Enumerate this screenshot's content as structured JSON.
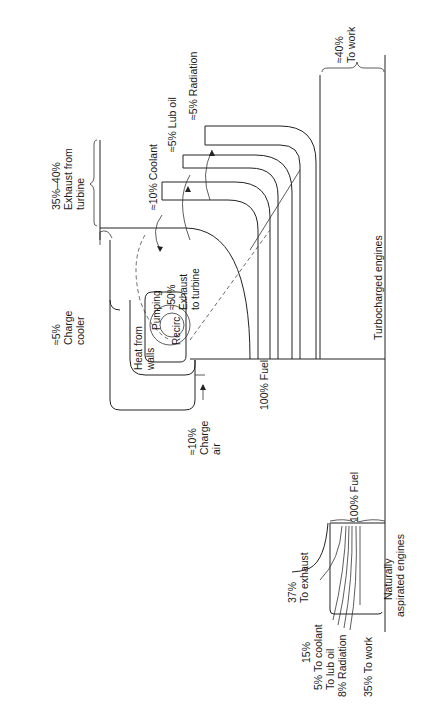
{
  "diagram": {
    "type": "sankey-energy-balance",
    "orientation": "rotated-90-ccw",
    "turbocharged": {
      "title": "Turbocharged engines",
      "fuel": "100% Fuel",
      "work": {
        "line1": "≈40%",
        "line2": "To work"
      },
      "radiation": "≈5% Radiation",
      "lub_oil": "≈5% Lub oil",
      "coolant": "≈10% Coolant",
      "exhaust_to_turbine": {
        "line1": "≈50%",
        "line2": "Exhaust",
        "line3": "to turbine"
      },
      "exhaust_from_turbine": {
        "line1": "35%–40%",
        "line2": "Exhaust from",
        "line3": "turbine"
      },
      "charge_cooler": {
        "line1": "≈5%",
        "line2": "Charge",
        "line3": "cooler"
      },
      "charge_air": {
        "line1": "≈10%",
        "line2": "Charge",
        "line3": "air"
      },
      "pumping": "Pumping",
      "recirc": "Recirc",
      "heat_from_walls": {
        "line1": "Heat from",
        "line2": "walls"
      }
    },
    "naturally_aspirated": {
      "title": {
        "line1": "Naturally",
        "line2": "aspirated engines"
      },
      "fuel": "100% Fuel",
      "exhaust": {
        "line1": "37%",
        "line2": "To exhaust"
      },
      "coolant": {
        "line1": "15%",
        "line2": "5% To coolant"
      },
      "lub_oil": "To lub oil",
      "radiation": "8% Radiation",
      "work": "35% To work"
    }
  }
}
